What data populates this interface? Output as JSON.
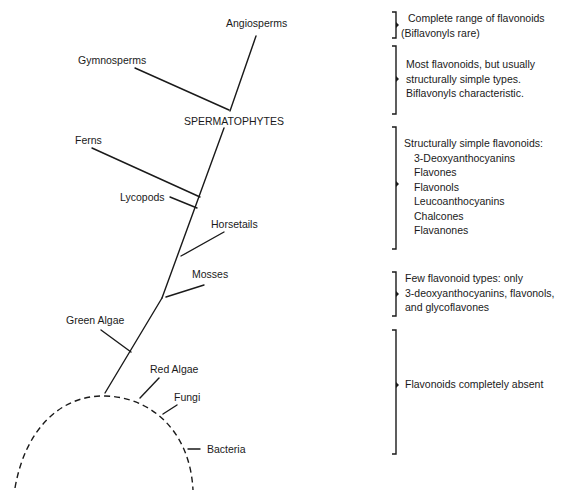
{
  "tree": {
    "taxa": {
      "angiosperms": "Angiosperms",
      "gymnosperms": "Gymnosperms",
      "spermatophytes": "SPERMATOPHYTES",
      "ferns": "Ferns",
      "lycopods": "Lycopods",
      "horsetails": "Horsetails",
      "mosses": "Mosses",
      "green_algae": "Green Algae",
      "red_algae": "Red Algae",
      "fungi": "Fungi",
      "bacteria": "Bacteria"
    }
  },
  "annotations": {
    "angiosperms": {
      "lines": [
        "Complete range of flavonoids",
        "(Biflavonyls rare)"
      ]
    },
    "gymnosperms": {
      "lines": [
        "Most flavonoids, but usually",
        "structurally simple types.",
        "Biflavonyls characteristic."
      ]
    },
    "pteridophytes": {
      "heading": "Structurally simple flavonoids:",
      "items": [
        "3-Deoxyanthocyanins",
        "Flavones",
        "Flavonols",
        "Leucoanthocyanins",
        "Chalcones",
        "Flavanones"
      ]
    },
    "mosses": {
      "lines": [
        "Few flavonoid types: only",
        "3-deoxyanthocyanins, flavonols,",
        "and glycoflavones"
      ]
    },
    "lower": {
      "lines": [
        "Flavonoids completely absent"
      ]
    }
  }
}
